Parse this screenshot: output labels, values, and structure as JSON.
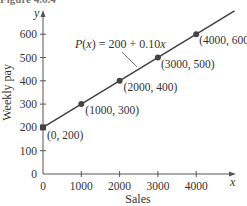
{
  "caption": "Figure 4.6.4",
  "chart_data": {
    "type": "line",
    "title": "",
    "xlabel": "Sales",
    "ylabel": "Weekly pay",
    "x_axis_var": "x",
    "y_axis_var": "y",
    "xlim": [
      0,
      5000
    ],
    "ylim": [
      0,
      700
    ],
    "x_ticks": [
      0,
      1000,
      2000,
      3000,
      4000
    ],
    "x_tick_labels": [
      "0",
      "1000",
      "2000",
      "3000",
      "4000"
    ],
    "y_ticks": [
      0,
      100,
      200,
      300,
      400,
      500,
      600
    ],
    "y_tick_labels": [
      "0",
      "100",
      "200",
      "300",
      "400",
      "500",
      "600"
    ],
    "grid": false,
    "legend": "none",
    "series": [
      {
        "name": "P(x) = 200 + 0.10x",
        "x": [
          0,
          1000,
          2000,
          3000,
          4000
        ],
        "values": [
          200,
          300,
          400,
          500,
          600
        ]
      }
    ],
    "annotations": [
      {
        "text": "P(x) = 200 + 0.10x",
        "target": [
          2800,
          480
        ]
      },
      {
        "text": "(0, 200)",
        "point": [
          0,
          200
        ]
      },
      {
        "text": "(1000, 300)",
        "point": [
          1000,
          300
        ]
      },
      {
        "text": "(2000, 400)",
        "point": [
          2000,
          400
        ]
      },
      {
        "text": "(3000, 500)",
        "point": [
          3000,
          500
        ]
      },
      {
        "text": "(4000, 600)",
        "point": [
          4000,
          600
        ]
      }
    ],
    "line_color": "#444444",
    "point_color": "#444444"
  },
  "labels": {
    "fn_prefix": "P",
    "fn_arg": "(x)",
    "fn_rest": " = 200 + 0.10",
    "fn_var": "x"
  }
}
